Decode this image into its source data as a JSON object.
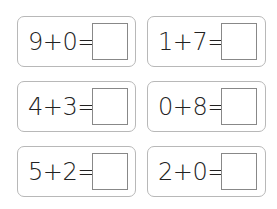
{
  "worksheet": {
    "problems": [
      {
        "expression": "9+0=",
        "answer": ""
      },
      {
        "expression": "1+7=",
        "answer": ""
      },
      {
        "expression": "4+3=",
        "answer": ""
      },
      {
        "expression": "0+8=",
        "answer": ""
      },
      {
        "expression": "5+2=",
        "answer": ""
      },
      {
        "expression": "2+0=",
        "answer": ""
      }
    ]
  }
}
